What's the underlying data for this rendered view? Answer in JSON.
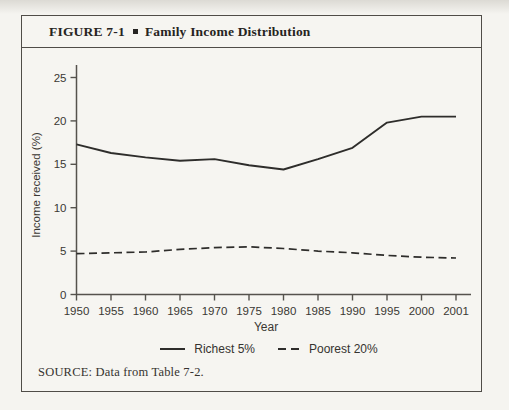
{
  "figure": {
    "label": "FIGURE 7-1",
    "title": "Family Income Distribution",
    "source": "SOURCE: Data from Table 7-2."
  },
  "chart_data": {
    "type": "line",
    "title": "Family Income Distribution",
    "xlabel": "Year",
    "ylabel": "Income received (%)",
    "categories": [
      "1950",
      "1955",
      "1960",
      "1965",
      "1970",
      "1975",
      "1980",
      "1985",
      "1990",
      "1995",
      "2000",
      "2001"
    ],
    "series": [
      {
        "name": "Richest 5%",
        "line_style": "solid",
        "values": [
          17.3,
          16.3,
          15.8,
          15.4,
          15.6,
          14.9,
          14.4,
          15.6,
          16.9,
          19.8,
          20.5,
          20.5
        ]
      },
      {
        "name": "Poorest 20%",
        "line_style": "dashed",
        "values": [
          4.7,
          4.8,
          4.9,
          5.2,
          5.4,
          5.5,
          5.3,
          5.0,
          4.8,
          4.5,
          4.3,
          4.2
        ]
      }
    ],
    "ylim": [
      0,
      26
    ],
    "yticks": [
      0,
      5,
      10,
      15,
      20,
      25
    ],
    "grid": false,
    "legend_position": "bottom-center"
  },
  "colors": {
    "paper": "#f6f5f1",
    "ink": "#2e2d2b",
    "axis": "#55524d",
    "text": "#3a3833",
    "border": "#504d48"
  }
}
